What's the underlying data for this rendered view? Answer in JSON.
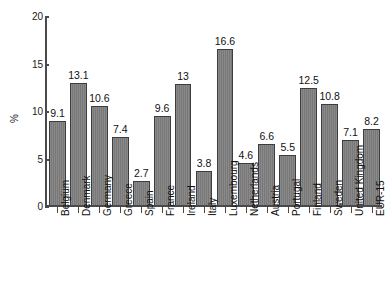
{
  "chart_data": {
    "type": "bar",
    "title": "",
    "xlabel": "",
    "ylabel": "%",
    "ylim": [
      0,
      20
    ],
    "yticks": [
      0,
      5,
      10,
      15,
      20
    ],
    "grid": false,
    "legend": null,
    "bar_color": "#7d7d7d",
    "bar_edge_color": "#3d3d3d",
    "categories": [
      "Belgium",
      "Denmark",
      "Germany",
      "Greece",
      "Spain",
      "France",
      "Ireland",
      "Italy",
      "Luxembourg",
      "Netherlands",
      "Austria",
      "Portugal",
      "Finland",
      "Sweden",
      "United Kingdom",
      "EUR-15"
    ],
    "values": [
      9.1,
      13.1,
      10.6,
      7.4,
      2.7,
      9.6,
      13,
      3.8,
      16.6,
      4.6,
      6.6,
      5.5,
      12.5,
      10.8,
      7.1,
      8.2
    ],
    "value_labels": [
      "9.1",
      "13.1",
      "10.6",
      "7.4",
      "2.7",
      "9.6",
      "13",
      "3.8",
      "16.6",
      "4.6",
      "6.6",
      "5.5",
      "12.5",
      "10.8",
      "7.1",
      "8.2"
    ]
  }
}
